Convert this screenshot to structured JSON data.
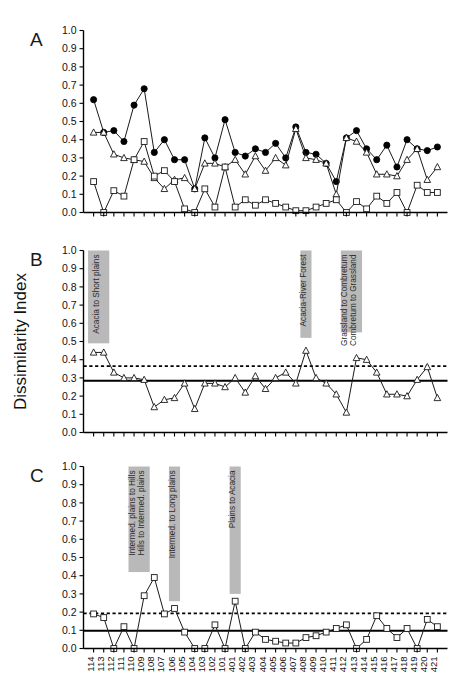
{
  "figure": {
    "y_axis_title": "Dissimilarity Index",
    "y_tick_labels": [
      "1.0",
      "0.9",
      "0.8",
      "0.7",
      "0.6",
      "0.5",
      "0.4",
      "0.3",
      "0.2",
      "0.1",
      "0.0"
    ],
    "x_tick_labels": [
      "114",
      "113",
      "112",
      "111",
      "110",
      "109",
      "108",
      "107",
      "106",
      "105",
      "104",
      "103",
      "102",
      "101",
      "401",
      "402",
      "403",
      "404",
      "405",
      "406",
      "407",
      "408",
      "409",
      "410",
      "411",
      "412",
      "413",
      "414",
      "415",
      "416",
      "417",
      "418",
      "419",
      "420",
      "421"
    ],
    "panel_labels": {
      "a": "A",
      "b": "B",
      "c": "C"
    }
  },
  "chart_data": [
    {
      "type": "line",
      "panel": "A",
      "title": "",
      "xlabel": "",
      "ylabel": "Dissimilarity Index",
      "ylim": [
        0.0,
        1.0
      ],
      "grid": false,
      "legend": "none",
      "x": [
        "114",
        "113",
        "112",
        "111",
        "110",
        "109",
        "108",
        "107",
        "106",
        "105",
        "104",
        "103",
        "102",
        "101",
        "401",
        "402",
        "403",
        "404",
        "405",
        "406",
        "407",
        "408",
        "409",
        "410",
        "411",
        "412",
        "413",
        "414",
        "415",
        "416",
        "417",
        "418",
        "419",
        "420",
        "421"
      ],
      "series": [
        {
          "name": "Overall dissimilarity (filled circle)",
          "marker": "filled-circle",
          "values": [
            0.62,
            0.44,
            0.45,
            0.39,
            0.59,
            0.68,
            0.33,
            0.4,
            0.29,
            0.29,
            0.13,
            0.41,
            0.3,
            0.51,
            0.33,
            0.31,
            0.35,
            0.33,
            0.38,
            0.3,
            0.47,
            0.33,
            0.32,
            0.27,
            0.17,
            0.41,
            0.45,
            0.35,
            0.29,
            0.37,
            0.25,
            0.4,
            0.35,
            0.34,
            0.36
          ]
        },
        {
          "name": "Species turnover (open triangle)",
          "marker": "open-triangle",
          "values": [
            0.44,
            0.44,
            0.32,
            0.3,
            0.29,
            0.28,
            0.19,
            0.13,
            0.18,
            0.19,
            0.13,
            0.27,
            0.27,
            0.25,
            0.29,
            0.21,
            0.31,
            0.23,
            0.3,
            0.26,
            0.46,
            0.3,
            0.29,
            0.27,
            0.1,
            0.41,
            0.39,
            0.33,
            0.21,
            0.21,
            0.2,
            0.29,
            0.35,
            0.18,
            0.25
          ]
        },
        {
          "name": "Abundance difference (open square)",
          "marker": "open-square",
          "values": [
            0.17,
            0.0,
            0.12,
            0.09,
            0.29,
            0.39,
            0.2,
            0.23,
            0.17,
            0.02,
            0.0,
            0.13,
            0.03,
            0.25,
            0.03,
            0.07,
            0.04,
            0.07,
            0.05,
            0.03,
            0.01,
            0.01,
            0.03,
            0.05,
            0.07,
            0.0,
            0.06,
            0.02,
            0.09,
            0.05,
            0.11,
            0.0,
            0.15,
            0.11,
            0.11
          ]
        }
      ],
      "bands": []
    },
    {
      "type": "line",
      "panel": "B",
      "title": "",
      "xlabel": "",
      "ylabel": "Dissimilarity Index",
      "ylim": [
        0.0,
        1.0
      ],
      "grid": false,
      "legend": "none",
      "x": [
        "114",
        "113",
        "112",
        "111",
        "110",
        "109",
        "108",
        "107",
        "106",
        "105",
        "104",
        "103",
        "102",
        "101",
        "401",
        "402",
        "403",
        "404",
        "405",
        "406",
        "407",
        "408",
        "409",
        "410",
        "411",
        "412",
        "413",
        "414",
        "415",
        "416",
        "417",
        "418",
        "419",
        "420",
        "421"
      ],
      "series": [
        {
          "name": "Species turnover (open triangle)",
          "marker": "open-triangle",
          "values": [
            0.44,
            0.44,
            0.33,
            0.3,
            0.3,
            0.29,
            0.14,
            0.18,
            0.19,
            0.27,
            0.13,
            0.27,
            0.27,
            0.25,
            0.3,
            0.22,
            0.31,
            0.24,
            0.3,
            0.33,
            0.27,
            0.45,
            0.3,
            0.27,
            0.21,
            0.11,
            0.41,
            0.4,
            0.33,
            0.21,
            0.21,
            0.2,
            0.29,
            0.36,
            0.19,
            0.25
          ]
        }
      ],
      "reference_lines": [
        {
          "name": "mean",
          "style": "solid",
          "value": 0.285
        },
        {
          "name": "upper-threshold",
          "style": "dashed",
          "value": 0.365
        }
      ],
      "bands": [
        {
          "label": "Acacia to Short plains",
          "start_index": 0,
          "end_index": 1,
          "top": 1.0,
          "bottom": 0.49
        },
        {
          "label": "Acacia-River Forest",
          "start_index": 21,
          "end_index": 21,
          "top": 1.0,
          "bottom": 0.52
        },
        {
          "label": "Grassland to Combretum\nCombretum to Grassland",
          "label_line1": "Grassland to Combretum",
          "label_line2": "Combretum to Grassland",
          "start_index": 25,
          "end_index": 26,
          "top": 1.0,
          "bottom": 0.55
        }
      ]
    },
    {
      "type": "line",
      "panel": "C",
      "title": "",
      "xlabel": "",
      "ylabel": "Dissimilarity Index",
      "ylim": [
        0.0,
        1.0
      ],
      "grid": false,
      "legend": "none",
      "x": [
        "114",
        "113",
        "112",
        "111",
        "110",
        "109",
        "108",
        "107",
        "106",
        "105",
        "104",
        "103",
        "102",
        "101",
        "401",
        "402",
        "403",
        "404",
        "405",
        "406",
        "407",
        "408",
        "409",
        "410",
        "411",
        "412",
        "413",
        "414",
        "415",
        "416",
        "417",
        "418",
        "419",
        "420",
        "421"
      ],
      "series": [
        {
          "name": "Abundance difference (open square)",
          "marker": "open-square",
          "values": [
            0.19,
            0.17,
            0.0,
            0.12,
            0.0,
            0.29,
            0.39,
            0.19,
            0.22,
            0.09,
            0.0,
            0.0,
            0.13,
            0.0,
            0.26,
            0.0,
            0.09,
            0.05,
            0.04,
            0.03,
            0.03,
            0.06,
            0.07,
            0.09,
            0.11,
            0.13,
            0.0,
            0.05,
            0.18,
            0.11,
            0.06,
            0.11,
            0.0,
            0.16,
            0.12
          ]
        }
      ],
      "reference_lines": [
        {
          "name": "mean",
          "style": "solid",
          "value": 0.097
        },
        {
          "name": "upper-threshold",
          "style": "dashed",
          "value": 0.193
        }
      ],
      "bands": [
        {
          "label": "Intermed. plains to Hills\nHills to Intermed. plains",
          "label_line1": "Intermed. plains to Hills",
          "label_line2": "Hills to Intermed. plains",
          "start_index": 4,
          "end_index": 5,
          "top": 1.0,
          "bottom": 0.42
        },
        {
          "label": "Intermed. to Long plains",
          "start_index": 8,
          "end_index": 8,
          "top": 1.0,
          "bottom": 0.26
        },
        {
          "label": "Plains to Acacia",
          "start_index": 14,
          "end_index": 14,
          "top": 1.0,
          "bottom": 0.3
        }
      ]
    }
  ]
}
